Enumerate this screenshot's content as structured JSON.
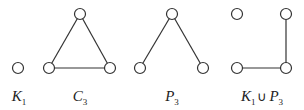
{
  "graphs": [
    {
      "id": "K1",
      "label_main": "K",
      "label_sub": "1",
      "label_x": 19,
      "nodes": [
        [
          18,
          68
        ]
      ],
      "edges": []
    },
    {
      "id": "C3",
      "label_main": "C",
      "label_sub": "3",
      "label_x": 80,
      "nodes": [
        [
          80,
          14
        ],
        [
          49,
          68
        ],
        [
          110,
          68
        ]
      ],
      "edges": [
        [
          0,
          1
        ],
        [
          0,
          2
        ],
        [
          1,
          2
        ]
      ]
    },
    {
      "id": "P3",
      "label_main": "P",
      "label_sub": "3",
      "label_x": 172,
      "nodes": [
        [
          172,
          14
        ],
        [
          140,
          68
        ],
        [
          203,
          68
        ]
      ],
      "edges": [
        [
          0,
          1
        ],
        [
          0,
          2
        ]
      ]
    },
    {
      "id": "K1uP3",
      "label_main": "K",
      "label_sub": "1",
      "label_union": "∪",
      "label_main2": "P",
      "label_sub2": "3",
      "label_x": 262,
      "nodes": [
        [
          237,
          14
        ],
        [
          286,
          14
        ],
        [
          237,
          68
        ],
        [
          286,
          68
        ]
      ],
      "edges": [
        [
          1,
          3
        ],
        [
          2,
          3
        ]
      ]
    }
  ],
  "style": {
    "stroke": "#333333",
    "node_radius": 5.5,
    "label_y": 90
  }
}
